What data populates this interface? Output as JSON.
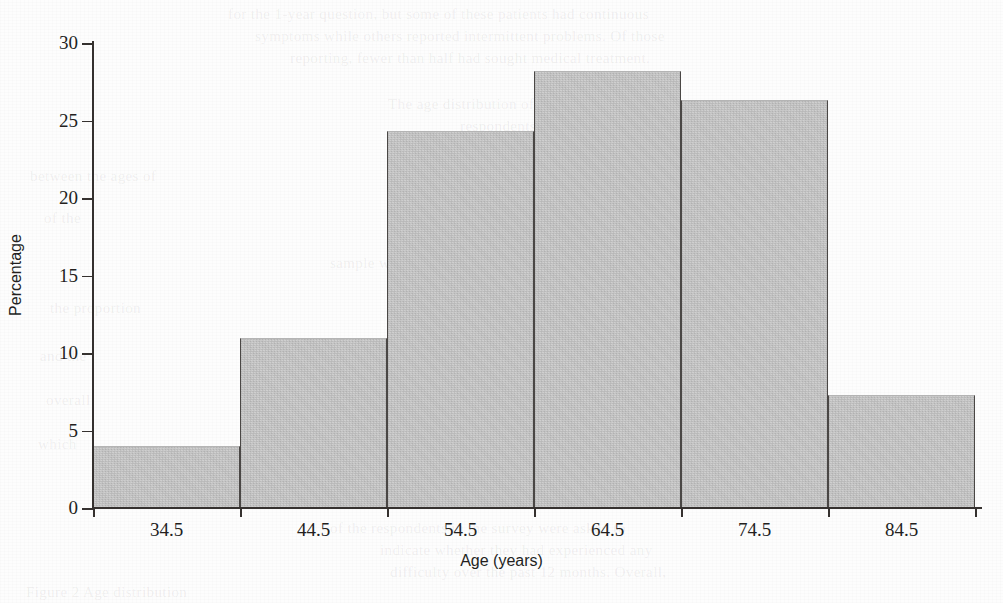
{
  "chart_data": {
    "type": "bar",
    "title": "",
    "subtitle": "",
    "xlabel": "Age (years)",
    "ylabel": "Percentage",
    "categories": [
      "34.5",
      "44.5",
      "54.5",
      "64.5",
      "74.5",
      "84.5"
    ],
    "values": [
      4.0,
      11.0,
      24.3,
      28.2,
      26.3,
      7.3
    ],
    "series": [
      {
        "name": "Percentage",
        "values": [
          4.0,
          11.0,
          24.3,
          28.2,
          26.3,
          7.3
        ]
      }
    ],
    "ylim": [
      0,
      30
    ],
    "xlim": [
      29.5,
      89.5
    ],
    "y_ticks": [
      "0",
      "5",
      "10",
      "15",
      "20",
      "25",
      "30"
    ],
    "y_tick_values": [
      0,
      5,
      10,
      15,
      20,
      25,
      30
    ],
    "x_ticks": [
      "34.5",
      "44.5",
      "54.5",
      "64.5",
      "74.5",
      "84.5"
    ],
    "grid": false,
    "legend": false,
    "legend_position": "none",
    "bar_style": "histogram-adjacent",
    "bin_width": 10,
    "annotations": []
  },
  "style": {
    "bar_fill": "#c9c9c9",
    "bar_border": "#4a4745",
    "axis_color": "#35312f",
    "text_color": "#231f1e",
    "background": "#fdfdfd"
  },
  "ghost_text": [
    {
      "text": "for the 1-year question, but some of these patients had continuous",
      "x": 228,
      "y": 6
    },
    {
      "text": "symptoms while others reported intermittent problems. Of those",
      "x": 255,
      "y": 28
    },
    {
      "text": "reporting, fewer than half had sought medical treatment.",
      "x": 290,
      "y": 50
    },
    {
      "text": "The age distribution of the sample is shown in",
      "x": 388,
      "y": 96
    },
    {
      "text": "respondents were aged",
      "x": 460,
      "y": 118
    },
    {
      "text": "between the ages of",
      "x": 30,
      "y": 168
    },
    {
      "text": "reported in the",
      "x": 612,
      "y": 170
    },
    {
      "text": "of the",
      "x": 44,
      "y": 210
    },
    {
      "text": "sample were",
      "x": 330,
      "y": 255
    },
    {
      "text": "was similar across",
      "x": 610,
      "y": 256
    },
    {
      "text": "the proportion",
      "x": 50,
      "y": 300
    },
    {
      "text": "in older",
      "x": 612,
      "y": 302
    },
    {
      "text": "and the",
      "x": 40,
      "y": 348
    },
    {
      "text": "remained",
      "x": 620,
      "y": 350
    },
    {
      "text": "overall",
      "x": 46,
      "y": 392
    },
    {
      "text": "stable",
      "x": 630,
      "y": 394
    },
    {
      "text": "which",
      "x": 38,
      "y": 436
    },
    {
      "text": "groups",
      "x": 626,
      "y": 438
    },
    {
      "text": "of the respondents in the survey were asked to",
      "x": 330,
      "y": 520
    },
    {
      "text": "indicate whether they had experienced any",
      "x": 380,
      "y": 542
    },
    {
      "text": "difficulty over the past 12 months. Overall,",
      "x": 390,
      "y": 564
    },
    {
      "text": "Figure 2 Age distribution",
      "x": 26,
      "y": 584
    }
  ]
}
